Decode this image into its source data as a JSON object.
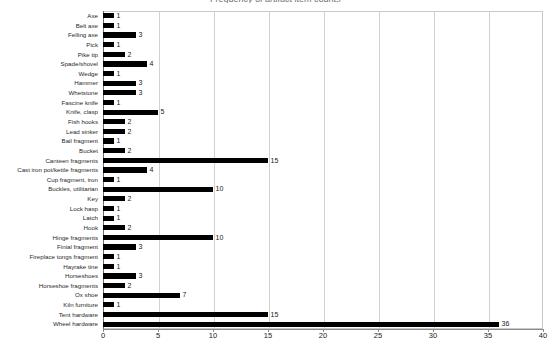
{
  "chart_data": {
    "type": "bar",
    "orientation": "horizontal",
    "title": "Frequency of artifact item counts",
    "xlabel": "",
    "ylabel": "",
    "xlim": [
      0,
      40
    ],
    "xticks": [
      0,
      5,
      10,
      15,
      20,
      25,
      30,
      35,
      40
    ],
    "grid": true,
    "legend": false,
    "bar_color": "#000000",
    "categories": [
      "Axe",
      "Belt axe",
      "Felling axe",
      "Pick",
      "Pike tip",
      "Spade/shovel",
      "Wedge",
      "Hammer",
      "Whetstone",
      "Fascine knife",
      "Knife, clasp",
      "Fish hooks",
      "Lead sinker",
      "Bail fragment",
      "Bucket",
      "Canteen fragments",
      "Cast iron pot/kettle fragments",
      "Cup fragment, iron",
      "Buckles, utilitarian",
      "Key",
      "Lock hasp",
      "Latch",
      "Hook",
      "Hinge fragments",
      "Finial fragment",
      "Fireplace tongs fragment",
      "Hayrake tine",
      "Horseshoes",
      "Horseshoe fragments",
      "Ox shoe",
      "Kiln furniture",
      "Tent hardware",
      "Wheel hardware"
    ],
    "values": [
      1,
      1,
      3,
      1,
      2,
      4,
      1,
      3,
      3,
      1,
      5,
      2,
      2,
      1,
      2,
      15,
      4,
      1,
      10,
      2,
      1,
      1,
      2,
      10,
      3,
      1,
      1,
      3,
      2,
      7,
      1,
      15,
      36
    ]
  }
}
